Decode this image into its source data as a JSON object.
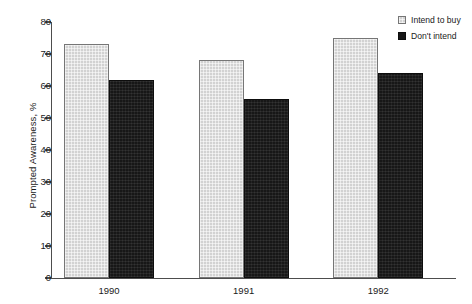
{
  "chart_data": {
    "type": "bar",
    "title": "",
    "xlabel": "",
    "ylabel": "Prompted Awareness, %",
    "categories": [
      "1990",
      "1991",
      "1992"
    ],
    "series": [
      {
        "name": "Intend to buy",
        "values": [
          73,
          68,
          75
        ],
        "color": "#d2d2d2"
      },
      {
        "name": "Don't intend",
        "values": [
          62,
          56,
          64
        ],
        "color": "#171717"
      }
    ],
    "ylim": [
      0,
      80
    ],
    "ytick_labels": [
      "0",
      "10",
      "20",
      "30",
      "40",
      "50",
      "60",
      "70",
      "80"
    ],
    "ytick_values": [
      0,
      10,
      20,
      30,
      40,
      50,
      60,
      70,
      80
    ],
    "grid": false,
    "legend_position": "top-right-outside"
  },
  "legend": {
    "entries": [
      {
        "label": "Intend to buy",
        "swatch": "light-gray-swatch"
      },
      {
        "label": "Don't intend",
        "swatch": "black-swatch"
      }
    ]
  }
}
